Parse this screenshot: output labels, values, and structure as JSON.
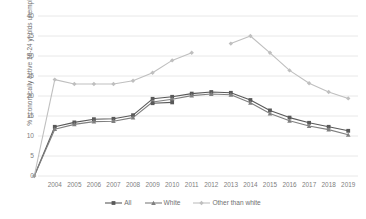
{
  "chart_data": {
    "type": "line",
    "title": "",
    "xlabel": "",
    "ylabel": "% economically active 16-24 yr olds unemployed",
    "x": [
      "",
      "2004",
      "2005",
      "2006",
      "2007",
      "2008",
      "2009",
      "2010",
      "2011",
      "2012",
      "2013",
      "2014",
      "2015",
      "2016",
      "2017",
      "2018",
      "2019"
    ],
    "categories": [
      "2004",
      "2005",
      "2006",
      "2007",
      "2008",
      "2009",
      "2010",
      "2011",
      "2012",
      "2013",
      "2014",
      "2015",
      "2016",
      "2017",
      "2018",
      "2019"
    ],
    "ylim": [
      0,
      40
    ],
    "yticks": [
      0,
      5,
      10,
      15,
      20,
      25,
      30,
      35,
      40
    ],
    "grid": true,
    "legend_position": "bottom",
    "origin_value": 0,
    "series": [
      {
        "name": "All",
        "color": "#595959",
        "marker": "square",
        "values": [
          12.3,
          13.4,
          14.2,
          14.3,
          15.2,
          19.3,
          19.8,
          20.6,
          21.0,
          20.8,
          19.0,
          16.4,
          14.6,
          13.3,
          12.3,
          11.3
        ]
      },
      {
        "name": "White",
        "color": "#7f7f7f",
        "marker": "triangle",
        "values": [
          11.7,
          12.9,
          13.6,
          13.7,
          14.6,
          18.5,
          19.2,
          20.1,
          20.5,
          20.3,
          18.3,
          15.6,
          13.8,
          12.5,
          11.6,
          10.3
        ]
      },
      {
        "name": "Other than white",
        "color": "#bfbfbf",
        "marker": "diamond",
        "values": [
          24.1,
          23.0,
          23.0,
          23.0,
          23.8,
          25.8,
          28.9,
          30.8,
          null,
          33.1,
          35.0,
          30.8,
          26.4,
          23.2,
          21.0,
          19.4
        ]
      }
    ],
    "extra_segments": [
      {
        "name": "All-stub",
        "color": "#595959",
        "marker": "square",
        "from_x": "2009",
        "to_x": "2010",
        "values": [
          18.2,
          18.4
        ]
      }
    ]
  },
  "legend": {
    "items": [
      {
        "label": "All",
        "color": "#595959",
        "marker": "square"
      },
      {
        "label": "White",
        "color": "#7f7f7f",
        "marker": "triangle"
      },
      {
        "label": "Other than white",
        "color": "#bfbfbf",
        "marker": "diamond"
      }
    ]
  },
  "axes": {
    "y_label": "% economically active 16-24 yr olds unemployed",
    "y_ticks": [
      "0",
      "5",
      "10",
      "15",
      "20",
      "25",
      "30",
      "35",
      "40"
    ],
    "x_ticks": [
      "2004",
      "2005",
      "2006",
      "2007",
      "2008",
      "2009",
      "2010",
      "2011",
      "2012",
      "2013",
      "2014",
      "2015",
      "2016",
      "2017",
      "2018",
      "2019"
    ]
  },
  "colors": {
    "grid": "#e2e2e2",
    "axis_text": "#808080",
    "background": "#ffffff"
  }
}
